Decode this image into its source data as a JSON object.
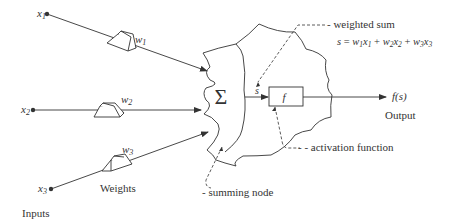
{
  "diagram": {
    "inputs": [
      {
        "name": "x",
        "sub": "1"
      },
      {
        "name": "x",
        "sub": "2"
      },
      {
        "name": "x",
        "sub": "3"
      }
    ],
    "weights": [
      {
        "name": "w",
        "sub": "1"
      },
      {
        "name": "w",
        "sub": "2"
      },
      {
        "name": "w",
        "sub": "3"
      }
    ],
    "labels": {
      "inputs": "Inputs",
      "weights": "Weights",
      "sigma": "Σ",
      "s": "s",
      "f": "f",
      "output_value": "f(s)",
      "output": "Output",
      "weighted_sum": "- weighted sum",
      "activation_function": "- - activation function",
      "summing_node": "- summing node"
    },
    "formula": {
      "lhs": "s",
      "eq": " = ",
      "terms": [
        {
          "w": "w",
          "ws": "1",
          "x": "x",
          "xs": "1"
        },
        {
          "w": "w",
          "ws": "2",
          "x": "x",
          "xs": "2"
        },
        {
          "w": "w",
          "ws": "3",
          "x": "x",
          "xs": "3"
        }
      ],
      "plus": " + "
    },
    "colors": {
      "line": "#333333",
      "background": "#ffffff"
    }
  }
}
